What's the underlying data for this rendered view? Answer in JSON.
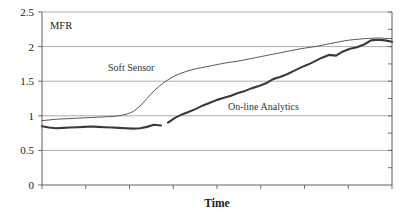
{
  "chart_data": {
    "type": "line",
    "title": "",
    "xlabel": "Time",
    "ylabel": "MFR",
    "ylim": [
      0,
      2.5
    ],
    "xlim": [
      0,
      100
    ],
    "y_ticks": [
      0,
      0.5,
      1,
      1.5,
      2,
      2.5
    ],
    "y_tick_labels": [
      "0",
      "0.5",
      "1",
      "1.5",
      "2",
      "2.5"
    ],
    "x_ticks": [
      0,
      12.5,
      25,
      37.5,
      50,
      62.5,
      75,
      87.5,
      100
    ],
    "x_tick_labels": [
      "",
      "",
      "",
      "",
      "",
      "",
      "",
      "",
      ""
    ],
    "grid": "horizontal",
    "legend": "inline-annotations",
    "annotations": [
      {
        "text": "Soft Sensor",
        "x": 22,
        "y": 1.68
      },
      {
        "text": "On-line Analytics",
        "x": 58,
        "y": 1.24
      },
      {
        "text": "MFR",
        "x": 3,
        "y": 2.37
      }
    ],
    "series": [
      {
        "name": "Soft Sensor",
        "style": "thin-line",
        "color": "#4a4a4a",
        "x": [
          0,
          2,
          4,
          6,
          8,
          10,
          12,
          14,
          16,
          18,
          20,
          22,
          24,
          26,
          28,
          30,
          32,
          34,
          36,
          38,
          40,
          42,
          44,
          46,
          48,
          50,
          52,
          54,
          56,
          58,
          60,
          62,
          64,
          66,
          68,
          70,
          72,
          74,
          76,
          78,
          80,
          82,
          84,
          86,
          88,
          90,
          92,
          94,
          96,
          98,
          100
        ],
        "values": [
          0.93,
          0.94,
          0.95,
          0.955,
          0.96,
          0.965,
          0.97,
          0.975,
          0.98,
          0.985,
          0.99,
          1.0,
          1.02,
          1.06,
          1.14,
          1.25,
          1.36,
          1.45,
          1.52,
          1.58,
          1.62,
          1.655,
          1.68,
          1.7,
          1.72,
          1.74,
          1.76,
          1.775,
          1.79,
          1.81,
          1.83,
          1.85,
          1.87,
          1.89,
          1.91,
          1.93,
          1.95,
          1.97,
          1.985,
          2.0,
          2.02,
          2.04,
          2.06,
          2.08,
          2.095,
          2.105,
          2.115,
          2.12,
          2.125,
          2.12,
          2.115
        ]
      },
      {
        "name": "On-line Analytics",
        "style": "thick-line",
        "color": "#3a3a3a",
        "x": [
          0,
          2,
          4,
          6,
          8,
          10,
          12,
          14,
          16,
          18,
          20,
          22,
          24,
          26,
          28,
          30,
          32,
          34,
          36,
          38,
          40,
          42,
          44,
          46,
          48,
          50,
          52,
          54,
          56,
          58,
          60,
          62,
          64,
          66,
          68,
          70,
          72,
          74,
          76,
          78,
          80,
          82,
          84,
          86,
          88,
          90,
          92,
          94,
          96,
          98,
          100
        ],
        "values": [
          0.85,
          0.83,
          0.82,
          0.825,
          0.83,
          0.835,
          0.84,
          0.845,
          0.84,
          0.835,
          0.83,
          0.825,
          0.82,
          0.815,
          0.82,
          0.84,
          0.87,
          0.86,
          0.9,
          0.97,
          1.02,
          1.06,
          1.1,
          1.15,
          1.19,
          1.23,
          1.26,
          1.29,
          1.33,
          1.36,
          1.4,
          1.43,
          1.47,
          1.53,
          1.56,
          1.6,
          1.65,
          1.7,
          1.74,
          1.79,
          1.84,
          1.88,
          1.87,
          1.93,
          1.97,
          1.99,
          2.03,
          2.09,
          2.1,
          2.09,
          2.07
        ],
        "gap_after_x": 34
      }
    ]
  },
  "axis": {
    "y_caption": "MFR",
    "x_caption": "Time"
  }
}
